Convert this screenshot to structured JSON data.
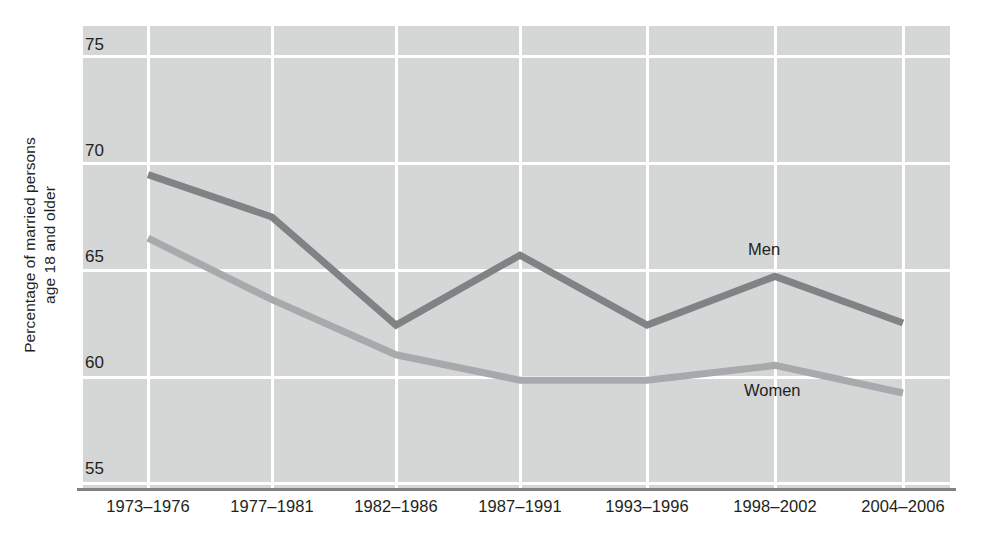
{
  "chart_data": {
    "type": "line",
    "title": "",
    "subtitle": "",
    "xlabel": "",
    "ylabel": "Percentage of married persons age 18 and older",
    "ylabel_lines": [
      "Percentage of married persons",
      "age 18 and older"
    ],
    "categories": [
      "1973–1976",
      "1977–1981",
      "1982–1986",
      "1987–1991",
      "1993–1996",
      "1998–2002",
      "2004–2006"
    ],
    "ylim": [
      55,
      75
    ],
    "yticks": [
      75,
      70,
      65,
      60,
      55
    ],
    "ytick_labels": [
      "75",
      "70",
      "65",
      "60",
      "55"
    ],
    "grid": true,
    "grid_color": "#ffffff",
    "plot_background": "#d5d6d6",
    "legend_position": "inline-labels",
    "series": [
      {
        "name": "Men",
        "label": "Men",
        "color": "#808285",
        "values": [
          69.5,
          67.5,
          62.4,
          65.7,
          62.4,
          64.7,
          62.5
        ]
      },
      {
        "name": "Women",
        "label": "Women",
        "color": "#a7a9ac",
        "values": [
          66.5,
          63.6,
          61.0,
          59.8,
          59.8,
          60.5,
          59.2
        ]
      }
    ]
  },
  "axis": {
    "baseline_color": "#808285"
  }
}
